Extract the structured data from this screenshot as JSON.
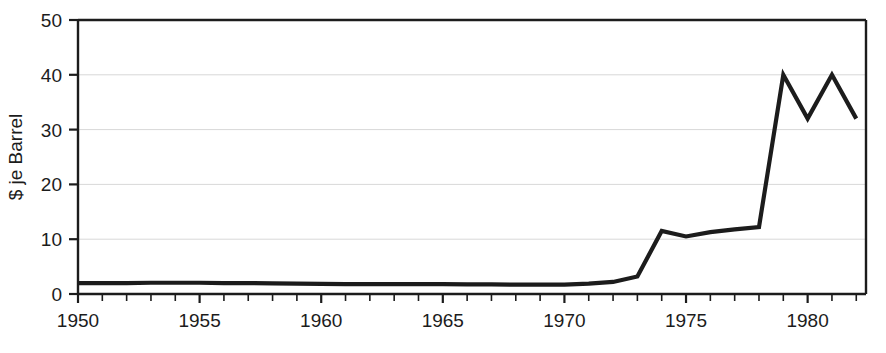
{
  "chart_data": {
    "type": "line",
    "title": "",
    "subtitle": "",
    "xlabel": "",
    "ylabel": "$ je Barrel",
    "xlim": [
      1950,
      1982.4
    ],
    "ylim": [
      0,
      50
    ],
    "grid": true,
    "legend": null,
    "x_tick_labels": [
      "1950",
      "1955",
      "1960",
      "1965",
      "1970",
      "1975",
      "1980"
    ],
    "x_tick_values": [
      1950,
      1955,
      1960,
      1965,
      1970,
      1975,
      1980
    ],
    "x_minor_tick_step": 1,
    "y_tick_labels": [
      "0",
      "10",
      "20",
      "30",
      "40",
      "50"
    ],
    "y_tick_values": [
      0,
      10,
      20,
      30,
      40,
      50
    ],
    "series": [
      {
        "name": "Rohölpreis",
        "color": "#1c1c1c",
        "line_width": 4.2,
        "x": [
          1950,
          1951,
          1952,
          1953,
          1954,
          1955,
          1956,
          1957,
          1958,
          1959,
          1960,
          1961,
          1962,
          1963,
          1964,
          1965,
          1966,
          1967,
          1968,
          1969,
          1970,
          1971,
          1972,
          1973,
          1974,
          1975,
          1976,
          1977,
          1978,
          1979,
          1980,
          1981,
          1982
        ],
        "values": [
          2.0,
          2.0,
          2.0,
          2.05,
          2.05,
          2.05,
          2.0,
          2.0,
          1.95,
          1.9,
          1.85,
          1.8,
          1.8,
          1.8,
          1.8,
          1.8,
          1.75,
          1.75,
          1.7,
          1.7,
          1.7,
          1.9,
          2.2,
          3.2,
          11.5,
          10.5,
          11.3,
          11.8,
          12.2,
          40.0,
          32.0,
          40.0,
          32.0
        ]
      }
    ]
  },
  "figure": {
    "background_color": "#ffffff",
    "axis_color": "#1c1c1c",
    "grid_color": "#d8d8d8"
  }
}
